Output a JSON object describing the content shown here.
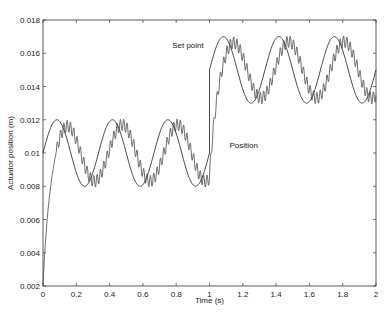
{
  "chart_data": {
    "type": "line",
    "title": "",
    "xlabel": "Time (s)",
    "ylabel": "Actuator position (m)",
    "xlim": [
      0,
      2
    ],
    "ylim": [
      0.002,
      0.018
    ],
    "grid": false,
    "legend": "none (inline annotations)",
    "xticks": [
      "0",
      "0.2",
      "0.4",
      "0.6",
      "0.8",
      "1",
      "1.2",
      "1.4",
      "1.6",
      "1.8",
      "2"
    ],
    "yticks": [
      "0.002",
      "0.004",
      "0.006",
      "0.008",
      "0.01",
      "0.012",
      "0.014",
      "0.016",
      "0.018"
    ],
    "series": [
      {
        "name": "Set point",
        "description": "Sinusoid 3 Hz, amplitude 0.002 m; offset 0.01 m for t<1 s, step to 0.015 m at t=1 s",
        "x": [
          0,
          0.083,
          0.167,
          0.25,
          0.333,
          0.417,
          0.5,
          0.583,
          0.667,
          0.75,
          0.833,
          0.917,
          1.0,
          1.0,
          1.083,
          1.167,
          1.25,
          1.333,
          1.417,
          1.5,
          1.583,
          1.667,
          1.75,
          1.833,
          1.917,
          2.0
        ],
        "values": [
          0.01,
          0.012,
          0.01,
          0.008,
          0.01,
          0.012,
          0.01,
          0.008,
          0.01,
          0.012,
          0.01,
          0.008,
          0.01,
          0.015,
          0.017,
          0.015,
          0.013,
          0.015,
          0.017,
          0.015,
          0.013,
          0.015,
          0.017,
          0.015,
          0.013,
          0.015
        ]
      },
      {
        "name": "Position",
        "description": "Lagging tracking response with high-frequency ripple; starts at 0.002 m",
        "x": [
          0,
          0.05,
          0.12,
          0.2,
          0.27,
          0.35,
          0.43,
          0.52,
          0.6,
          0.77,
          0.85,
          0.93,
          1.0,
          1.05,
          1.12,
          1.2,
          1.28,
          1.36,
          1.43,
          1.52,
          1.6,
          1.69,
          1.77,
          1.86,
          1.94,
          2.0
        ],
        "values": [
          0.002,
          0.009,
          0.0124,
          0.0105,
          0.0083,
          0.0095,
          0.0125,
          0.0108,
          0.0083,
          0.0124,
          0.0108,
          0.0083,
          0.0098,
          0.0125,
          0.0158,
          0.0148,
          0.0132,
          0.014,
          0.0172,
          0.016,
          0.0132,
          0.0142,
          0.0172,
          0.016,
          0.0132,
          0.0148
        ]
      }
    ],
    "annotations": [
      {
        "text": "Set point",
        "x": 0.98,
        "y": 0.0165
      },
      {
        "text": "Position",
        "x": 1.18,
        "y": 0.0105
      }
    ]
  }
}
